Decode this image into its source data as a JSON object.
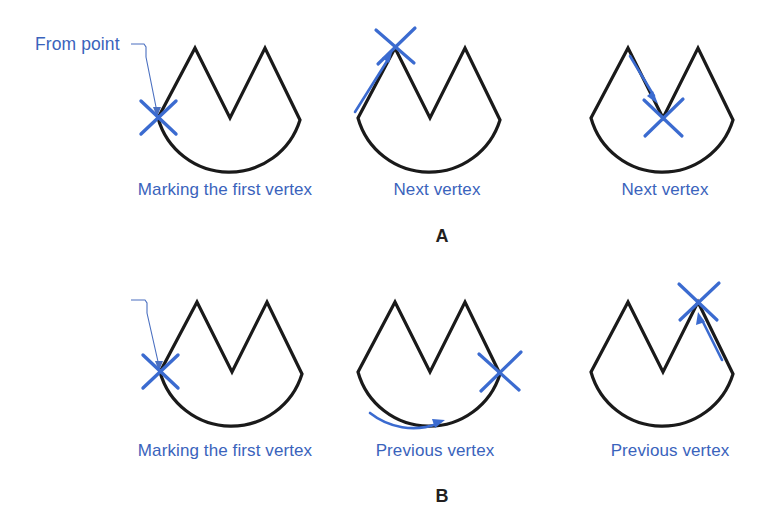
{
  "figure": {
    "type": "diagram",
    "title": "",
    "colors": {
      "annotation_blue": "#3a63bc",
      "mark_blue": "#3b6bd0",
      "outline_black": "#1a1a1a",
      "background": "#ffffff"
    },
    "shape": {
      "name": "crown-arc-polygon",
      "vertices": [
        {
          "name": "left-vertex",
          "x": 158,
          "y": 118
        },
        {
          "name": "left-peak",
          "x": 195,
          "y": 48
        },
        {
          "name": "middle-valley",
          "x": 230,
          "y": 118
        },
        {
          "name": "right-peak",
          "x": 265,
          "y": 48
        },
        {
          "name": "right-vertex",
          "x": 300,
          "y": 120
        }
      ],
      "arc_bottom": {
        "x": 230,
        "y": 166
      }
    }
  },
  "rows": [
    {
      "id": "A",
      "label": "A",
      "direction": "next",
      "panels": [
        {
          "id": "a1",
          "caption": "Marking the first vertex",
          "from_point_label": "From point",
          "has_leader": true,
          "mark_vertex": "left-vertex",
          "arrow": "none"
        },
        {
          "id": "a2",
          "caption": "Next vertex",
          "from_point_label": "",
          "has_leader": false,
          "mark_vertex": "left-peak",
          "arrow": "up-left-edge"
        },
        {
          "id": "a3",
          "caption": "Next vertex",
          "from_point_label": "",
          "has_leader": false,
          "mark_vertex": "middle-valley",
          "arrow": "down-inner-left-edge"
        }
      ]
    },
    {
      "id": "B",
      "label": "B",
      "direction": "previous",
      "panels": [
        {
          "id": "b1",
          "caption": "Marking the first vertex",
          "from_point_label": "From point",
          "has_leader": true,
          "mark_vertex": "left-vertex",
          "arrow": "none"
        },
        {
          "id": "b2",
          "caption": "Previous vertex",
          "from_point_label": "",
          "has_leader": false,
          "mark_vertex": "right-vertex",
          "arrow": "along-arc-right"
        },
        {
          "id": "b3",
          "caption": "Previous vertex",
          "from_point_label": "",
          "has_leader": false,
          "mark_vertex": "right-peak",
          "arrow": "up-right-edge"
        }
      ]
    }
  ]
}
